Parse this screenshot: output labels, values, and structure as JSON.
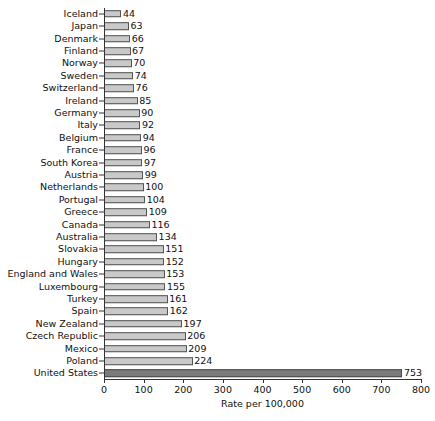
{
  "chart_data": {
    "type": "bar",
    "orientation": "horizontal",
    "title": "",
    "xlabel": "Rate per 100,000",
    "ylabel": "",
    "xlim": [
      0,
      800
    ],
    "xticks": [
      0,
      100,
      200,
      300,
      400,
      500,
      600,
      700,
      800
    ],
    "grid": false,
    "legend": null,
    "highlight_category": "United States",
    "colors": {
      "bar_fill": "#c9c9c9",
      "bar_edge": "#555555",
      "highlight_fill": "#7b7b7b",
      "highlight_edge": "#4a4a4a",
      "axis": "#333333",
      "text": "#111111",
      "background": "#ffffff"
    },
    "categories": [
      "Iceland",
      "Japan",
      "Denmark",
      "Finland",
      "Norway",
      "Sweden",
      "Switzerland",
      "Ireland",
      "Germany",
      "Italy",
      "Belgium",
      "France",
      "South Korea",
      "Austria",
      "Netherlands",
      "Portugal",
      "Greece",
      "Canada",
      "Australia",
      "Slovakia",
      "Hungary",
      "England and Wales",
      "Luxembourg",
      "Turkey",
      "Spain",
      "New Zealand",
      "Czech Republic",
      "Mexico",
      "Poland",
      "United States"
    ],
    "values": [
      44,
      63,
      66,
      67,
      70,
      74,
      76,
      85,
      90,
      92,
      94,
      96,
      97,
      99,
      100,
      104,
      109,
      116,
      134,
      151,
      152,
      153,
      155,
      161,
      162,
      197,
      206,
      209,
      224,
      753
    ],
    "value_labels": [
      "44",
      "63",
      "66",
      "67",
      "70",
      "74",
      "76",
      "85",
      "90",
      "92",
      "94",
      "96",
      "97",
      "99",
      "100",
      "104",
      "109",
      "116",
      "134",
      "151",
      "152",
      "153",
      "155",
      "161",
      "162",
      "197",
      "206",
      "209",
      "224",
      "753"
    ]
  }
}
